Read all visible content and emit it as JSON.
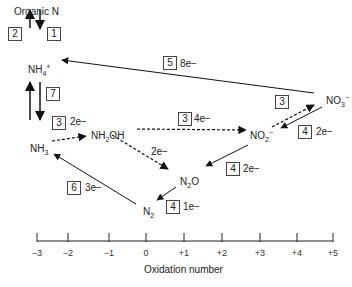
{
  "species": {
    "organic_n": "Organic N",
    "nh4": {
      "base": "NH",
      "sub": "4",
      "sup": "+"
    },
    "nh3": {
      "base": "NH",
      "sub": "3"
    },
    "nh2oh": {
      "base1": "NH",
      "sub": "2",
      "base2": "OH"
    },
    "no2": {
      "base": "NO",
      "sub": "2",
      "sup": "−"
    },
    "no3": {
      "base": "NO",
      "sub": "3",
      "sup": "−"
    },
    "n2o": {
      "base1": "N",
      "sub": "2",
      "base2": "O"
    },
    "n2": {
      "base": "N",
      "sub": "2"
    }
  },
  "processes": [
    {
      "id": "1",
      "electrons": ""
    },
    {
      "id": "2",
      "electrons": ""
    },
    {
      "id": "7",
      "electrons": ""
    },
    {
      "id": "3",
      "electrons": "2e−",
      "from": "NH3",
      "to": "NH2OH"
    },
    {
      "id": "3",
      "electrons": "4e−",
      "from": "NH2OH",
      "to": "NO2-"
    },
    {
      "id": "3",
      "electrons": "",
      "from": "NO2-",
      "to": "NO3-"
    },
    {
      "id": "5",
      "electrons": "8e−",
      "from": "NO3-",
      "to": "NH4+"
    },
    {
      "id": "4",
      "electrons": "2e−",
      "from": "NO3-",
      "to": "NO2-"
    },
    {
      "id": "4",
      "electrons": "2e−",
      "from": "NO2-",
      "to": "N2O"
    },
    {
      "id": "4",
      "electrons": "1e−",
      "from": "N2O",
      "to": "N2"
    },
    {
      "id": "6",
      "electrons": "3e−",
      "from": "N2",
      "to": "NH3"
    },
    {
      "id": "",
      "electrons": "2e−",
      "from": "NH2OH",
      "to": "N2O"
    }
  ],
  "axis": {
    "label": "Oxidation number",
    "ticks": [
      "−3",
      "−2",
      "−1",
      "0",
      "+1",
      "+2",
      "+3",
      "+4",
      "+5"
    ]
  }
}
